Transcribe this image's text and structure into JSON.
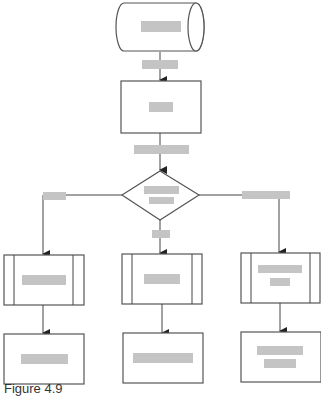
{
  "diagram": {
    "type": "flowchart",
    "caption": "Figure 4.9",
    "colors": {
      "stroke": "#555555",
      "label_redaction": "#c4c4c4",
      "background": "#ffffff"
    },
    "nodes": [
      {
        "id": "start",
        "shape": "cylinder",
        "label": "[redacted]",
        "label_lines": 1
      },
      {
        "id": "process1",
        "shape": "rectangle",
        "label": "[redacted]",
        "label_lines": 1
      },
      {
        "id": "decision",
        "shape": "diamond",
        "label": "[redacted]",
        "label_lines": 2
      },
      {
        "id": "sub_left",
        "shape": "predefined-process",
        "label": "[redacted]",
        "label_lines": 1
      },
      {
        "id": "sub_mid",
        "shape": "predefined-process",
        "label": "[redacted]",
        "label_lines": 1
      },
      {
        "id": "sub_right",
        "shape": "predefined-process",
        "label": "[redacted]",
        "label_lines": 2
      },
      {
        "id": "end_left",
        "shape": "rectangle",
        "label": "[redacted]",
        "label_lines": 1
      },
      {
        "id": "end_mid",
        "shape": "rectangle",
        "label": "[redacted]",
        "label_lines": 1
      },
      {
        "id": "end_right",
        "shape": "rectangle",
        "label": "[redacted]",
        "label_lines": 2
      }
    ],
    "edges": [
      {
        "from": "start",
        "to": "process1",
        "label": "[redacted]"
      },
      {
        "from": "process1",
        "to": "decision",
        "label": "[redacted]"
      },
      {
        "from": "decision",
        "to": "sub_left",
        "label": "[redacted]"
      },
      {
        "from": "decision",
        "to": "sub_mid",
        "label": "[redacted]"
      },
      {
        "from": "decision",
        "to": "sub_right",
        "label": "[redacted]"
      },
      {
        "from": "sub_left",
        "to": "end_left",
        "label": ""
      },
      {
        "from": "sub_mid",
        "to": "end_mid",
        "label": ""
      },
      {
        "from": "sub_right",
        "to": "end_right",
        "label": ""
      }
    ]
  }
}
